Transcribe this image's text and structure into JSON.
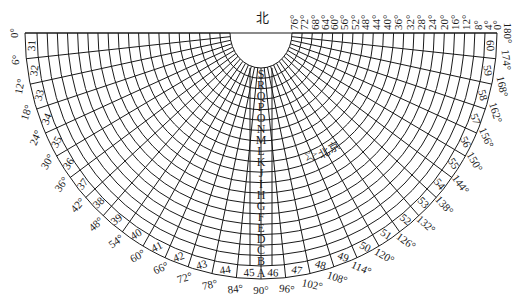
{
  "diagram": {
    "title_label": "北",
    "marker": {
      "symbol": "☆",
      "label": "北京",
      "x": 310,
      "y": 155
    },
    "colors": {
      "line": "#1a1a1a",
      "background": "#ffffff"
    },
    "top_labels": [
      "76°",
      "72°",
      "68°",
      "64°",
      "60°",
      "56°",
      "52°",
      "48°",
      "44°",
      "40°",
      "36°",
      "32°",
      "28°",
      "24°",
      "20°",
      "16°",
      "12°",
      "8°",
      "4°",
      "0°"
    ],
    "top_label_x": [
      294,
      304,
      315,
      325,
      334,
      344,
      355,
      365,
      376,
      387,
      398,
      410,
      421,
      432,
      444,
      455,
      466,
      478,
      488,
      497
    ],
    "center_letters": [
      "S",
      "R",
      "Q",
      "P",
      "O",
      "N",
      "M",
      "L",
      "K",
      "J",
      "I",
      "H",
      "G",
      "F",
      "E",
      "D",
      "C",
      "B"
    ],
    "ring_letter": "A",
    "ring_numbers": [
      "31",
      "32",
      "33",
      "34",
      "35",
      "36",
      "37",
      "38",
      "39",
      "40",
      "41",
      "42",
      "43",
      "44",
      "45",
      "46",
      "47",
      "48",
      "49",
      "50",
      "51",
      "52",
      "53",
      "54",
      "55",
      "56",
      "57",
      "58",
      "59",
      "60"
    ],
    "outer_degree_labels": [
      "0°",
      "6°",
      "12°",
      "18°",
      "24°",
      "30°",
      "36°",
      "42°",
      "48°",
      "54°",
      "60°",
      "66°",
      "72°",
      "78°",
      "84°",
      "90°",
      "96°",
      "102°",
      "108°",
      "114°",
      "120°",
      "126°",
      "132°",
      "138°",
      "144°",
      "150°",
      "156°",
      "162°",
      "168°",
      "174°",
      "180°"
    ]
  }
}
